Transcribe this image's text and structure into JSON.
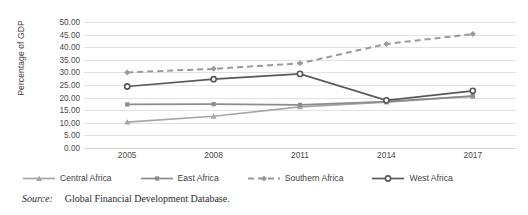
{
  "chart_data": {
    "type": "line",
    "title": "",
    "xlabel": "",
    "ylabel": "Percentage of GDP",
    "x": [
      "2005",
      "2008",
      "2011",
      "2014",
      "2017"
    ],
    "categories": [
      "2005",
      "2008",
      "2011",
      "2014",
      "2017"
    ],
    "ylim": [
      0,
      50
    ],
    "ytick_step": 5,
    "yticks": [
      "50.00",
      "45.00",
      "40.00",
      "35.00",
      "30.00",
      "25.00",
      "20.00",
      "15.00",
      "10.00",
      "5.00",
      "0.00"
    ],
    "grid": "horizontal",
    "legend_position": "bottom",
    "series": [
      {
        "name": "Central Africa",
        "values": [
          10.3,
          12.6,
          16.3,
          18.2,
          20.6
        ],
        "color": "#a6a6a6",
        "marker": "triangle",
        "dash": "solid"
      },
      {
        "name": "East Africa",
        "values": [
          17.3,
          17.4,
          17.1,
          18.4,
          20.6
        ],
        "color": "#8c8c8c",
        "marker": "square",
        "dash": "solid"
      },
      {
        "name": "Southern Africa",
        "values": [
          30.0,
          31.4,
          33.6,
          41.3,
          45.2
        ],
        "color": "#9a9a9a",
        "marker": "diamond",
        "dash": "dashed"
      },
      {
        "name": "West Africa",
        "values": [
          24.4,
          27.3,
          29.4,
          18.9,
          22.7
        ],
        "color": "#595959",
        "marker": "circle",
        "dash": "solid"
      }
    ]
  },
  "legend": {
    "items": [
      {
        "label": "Central Africa"
      },
      {
        "label": "East Africa"
      },
      {
        "label": "Southern Africa"
      },
      {
        "label": "West Africa"
      }
    ]
  },
  "source": {
    "label": "Source:",
    "text": "Global Financial Development Database."
  }
}
